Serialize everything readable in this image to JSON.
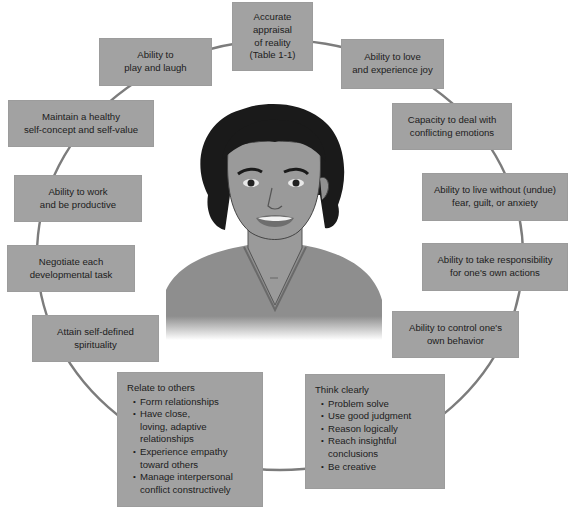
{
  "diagram": {
    "center": {
      "figure": "smiling-woman-portrait"
    },
    "colors": {
      "box_fill": "#a2a2a2",
      "text": "#1c1c1c",
      "connector": "#7c7c7c",
      "hair": "#1a1a1a",
      "skin": "#9a9a9a",
      "shirt": "#8e8e8e"
    },
    "nodes": [
      {
        "id": "accurate-appraisal",
        "text": "Accurate\nappraisal\nof reality\n(Table 1-1)"
      },
      {
        "id": "love-joy",
        "text": "Ability to love\nand experience joy"
      },
      {
        "id": "conflicting-emotions",
        "text": "Capacity to deal with\nconflicting emotions"
      },
      {
        "id": "live-without-fear",
        "text": "Ability to live without (undue)\nfear, guilt, or anxiety"
      },
      {
        "id": "take-responsibility",
        "text": "Ability to take responsibility\nfor one's own actions"
      },
      {
        "id": "control-behavior",
        "text": "Ability to control one's\nown behavior"
      },
      {
        "id": "think-clearly",
        "title": "Think clearly",
        "bullets": [
          "Problem solve",
          "Use good judgment",
          "Reason logically",
          "Reach insightful\nconclusions",
          "Be creative"
        ]
      },
      {
        "id": "relate-to-others",
        "title": "Relate to others",
        "bullets": [
          "Form relationships",
          "Have close,\nloving, adaptive\nrelationships",
          "Experience empathy\ntoward others",
          "Manage interpersonal\nconflict constructively"
        ]
      },
      {
        "id": "spirituality",
        "text": "Attain self-defined\nspirituality"
      },
      {
        "id": "developmental-task",
        "text": "Negotiate each\ndevelopmental task"
      },
      {
        "id": "work-productive",
        "text": "Ability to work\nand be productive"
      },
      {
        "id": "self-concept",
        "text": "Maintain a healthy\nself-concept and self-value"
      },
      {
        "id": "play-laugh",
        "text": "Ability to\nplay and laugh"
      }
    ]
  }
}
